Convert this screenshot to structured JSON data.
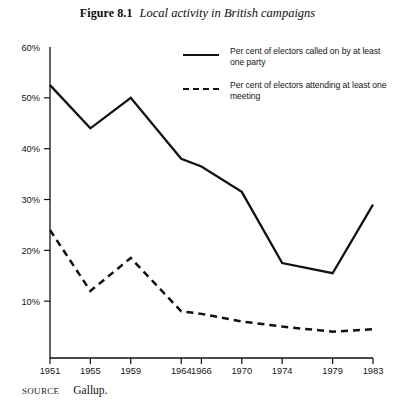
{
  "figure": {
    "number_label": "Figure 8.1",
    "title": "Local activity in British campaigns",
    "source_label": "SOURCE",
    "source_value": "Gallup."
  },
  "legend": {
    "position": "top-right",
    "entries": [
      {
        "style": "solid",
        "label": "Per cent of electors called on by at least one party"
      },
      {
        "style": "dashed",
        "label": "Per cent of electors attending at least one meeting"
      }
    ]
  },
  "chart_data": {
    "type": "line",
    "title": "Local activity in British campaigns",
    "xlabel": "",
    "ylabel": "",
    "grid": false,
    "legend_position": "top-right",
    "categories": [
      "1951",
      "1955",
      "1959",
      "1964",
      "1966",
      "1970",
      "1974",
      "1979",
      "1983"
    ],
    "x": [
      1951,
      1955,
      1959,
      1964,
      1966,
      1970,
      1974,
      1979,
      1983
    ],
    "xlim": [
      1951,
      1983
    ],
    "ylim": [
      0,
      60
    ],
    "ytick_labels": [
      "10%",
      "20%",
      "30%",
      "40%",
      "50%",
      "60%"
    ],
    "yticks": [
      10,
      20,
      30,
      40,
      50,
      60
    ],
    "series": [
      {
        "name": "Per cent of electors called on by at least one party",
        "style": "solid",
        "values": [
          52.5,
          44,
          50,
          38,
          36.5,
          31.5,
          17.5,
          15.5,
          29
        ]
      },
      {
        "name": "Per cent of electors attending at least one meeting",
        "style": "dashed",
        "values": [
          24,
          12,
          18.5,
          8,
          7.5,
          6,
          5,
          4,
          4.5
        ]
      }
    ]
  }
}
